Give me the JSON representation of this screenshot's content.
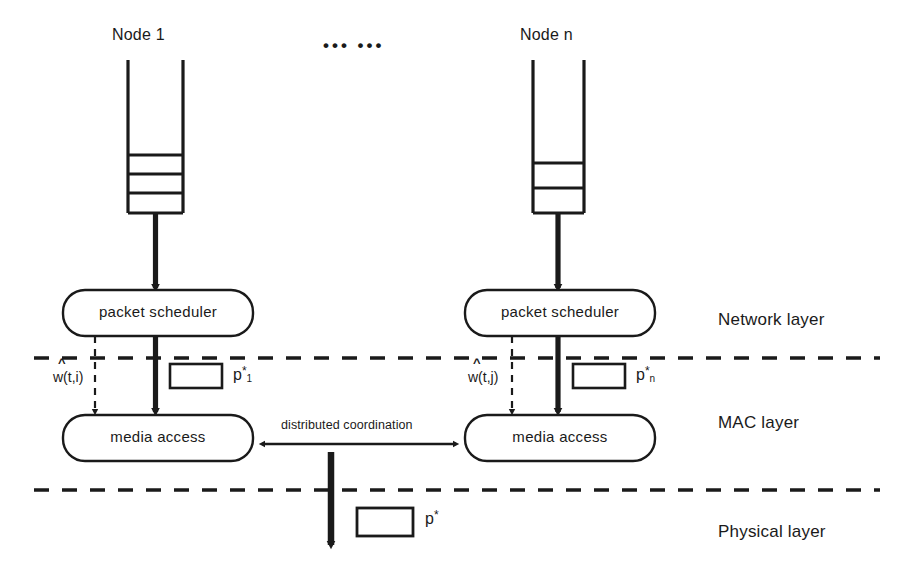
{
  "figure": {
    "type": "diagram",
    "nodes": [
      {
        "id": "node1",
        "title": "Node 1",
        "queue_cells": 3,
        "scheduler_label": "packet  scheduler",
        "mac_label": "media access",
        "weight_label": "w(t,i)",
        "weight_accent": "^",
        "packet_label_base": "p",
        "packet_label_sub": "1",
        "packet_label_sup": "*"
      },
      {
        "id": "noden",
        "title": "Node n",
        "queue_cells": 2,
        "scheduler_label": "packet  scheduler",
        "mac_label": "media access",
        "weight_label": "w(t,j)",
        "weight_accent": "^",
        "packet_label_base": "p",
        "packet_label_sub": "n",
        "packet_label_sup": "*"
      }
    ],
    "ellipsis": "•••  •••",
    "coordination_label": "distributed coordination",
    "output_packet": {
      "base": "p",
      "sup": "*"
    },
    "layers": [
      {
        "id": "network",
        "label": "Network layer"
      },
      {
        "id": "mac",
        "label": "MAC layer"
      },
      {
        "id": "physical",
        "label": "Physical layer"
      }
    ],
    "colors": {
      "stroke": "#1a1a1a",
      "background": "#ffffff",
      "text": "#1a1a1a"
    }
  }
}
